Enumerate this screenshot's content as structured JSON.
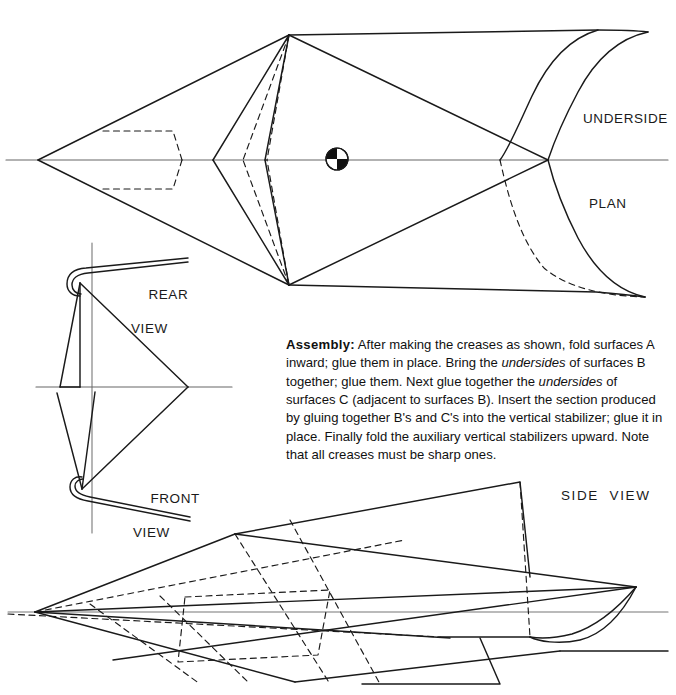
{
  "document": {
    "type": "technical-drawing",
    "subject": "paper-airplane-folding-plan"
  },
  "labels": {
    "underside": "UNDERSIDE",
    "plan": "PLAN",
    "rear_view_line1": "REAR",
    "rear_view_line2": "VIEW",
    "front_view_line1": "FRONT",
    "front_view_line2": "VIEW",
    "side_view": "SIDE  VIEW"
  },
  "assembly": {
    "heading": "Assembly:",
    "seg1": "  After making the creases as shown, fold surfaces A inward; glue them in place. Bring the ",
    "em1": "undersides",
    "seg2": " of surfaces B together; glue them. Next glue together the ",
    "em2": "undersides",
    "seg3": " of surfaces C (adjacent to surfaces B). Insert the section produced by gluing together B's and C's into the vertical stabilizer; glue it in place. Finally fold the auxiliary vertical stabilizers upward. Note that all creases must be sharp ones."
  },
  "colors": {
    "ink": "#1a1a1a",
    "centerline": "#555555",
    "paper": "#ffffff"
  },
  "views": {
    "plan": {
      "name": "plan-view",
      "centerline_y": 160,
      "nose_x": 38,
      "tail_tip_top": [
        648,
        32
      ],
      "tail_tip_bottom": [
        645,
        297
      ],
      "cg_marker": {
        "cx": 337,
        "cy": 159,
        "r": 11
      }
    },
    "rear_front": {
      "name": "rear-front-view",
      "centerline_y": 387,
      "vertical_axis_x": 92,
      "apex_right_x": 188
    },
    "side": {
      "name": "side-view",
      "centerline_y": 612,
      "nose_x": 35,
      "tail_x": 635
    }
  }
}
